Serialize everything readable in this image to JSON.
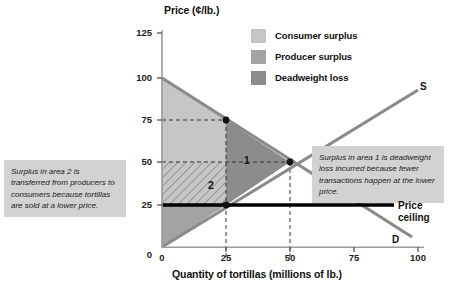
{
  "chart_data": {
    "type": "line",
    "title": "",
    "xlabel": "Quantity of tortillas (millions of lb.)",
    "ylabel": "Price (¢/lb.)",
    "xlim": [
      0,
      100
    ],
    "ylim": [
      0,
      125
    ],
    "xticks": [
      "0",
      "25",
      "50",
      "75",
      "100"
    ],
    "yticks": [
      "0",
      "25",
      "50",
      "75",
      "100",
      "125"
    ],
    "grid": false,
    "series": [
      {
        "name": "S",
        "label": "S",
        "type": "line",
        "x": [
          0,
          100
        ],
        "y": [
          0,
          100
        ],
        "color": "#8a8a8a"
      },
      {
        "name": "D",
        "label": "D",
        "type": "line",
        "x": [
          0,
          100
        ],
        "y": [
          100,
          0
        ],
        "color": "#8a8a8a"
      },
      {
        "name": "Price ceiling",
        "label": "Price ceiling",
        "type": "hline",
        "y": 25,
        "x": [
          0,
          100
        ],
        "color": "#000000"
      }
    ],
    "points": [
      {
        "x": 25,
        "y": 75,
        "note": "demand price at restricted quantity"
      },
      {
        "x": 50,
        "y": 50,
        "note": "free-market equilibrium"
      },
      {
        "x": 25,
        "y": 25,
        "note": "quantity supplied at price ceiling"
      }
    ],
    "regions": [
      {
        "label": "Consumer surplus",
        "color": "#c6c6c6"
      },
      {
        "label": "Producer surplus",
        "color": "#a3a3a3"
      },
      {
        "label": "Deadweight loss",
        "color": "#8c8c8c",
        "number": "1"
      },
      {
        "label": "Transferred surplus",
        "number": "2",
        "hatched": true
      }
    ]
  },
  "axes": {
    "y_title": "Price (¢/lb.)",
    "x_title": "Quantity of tortillas (millions of lb.)",
    "y_ticks": [
      "125",
      "100",
      "75",
      "50",
      "25",
      "0"
    ],
    "x_ticks": [
      "0",
      "25",
      "50",
      "75",
      "100"
    ]
  },
  "legend": {
    "items": [
      {
        "label": "Consumer surplus",
        "color": "#c6c6c6"
      },
      {
        "label": "Producer surplus",
        "color": "#a3a3a3"
      },
      {
        "label": "Deadweight loss",
        "color": "#8c8c8c"
      }
    ]
  },
  "annotations": {
    "left": "Surplus in area 2 is transferred from producers to consumers because tortillas are sold at a lower price.",
    "right": "Surplus in area 1 is deadweight loss incurred because fewer transactions happen at the lower price."
  },
  "curve_labels": {
    "supply": "S",
    "demand": "D",
    "price_ceiling": "Price\nceiling"
  },
  "region_numbers": {
    "deadweight": "1",
    "transfer": "2"
  },
  "colors": {
    "consumer_surplus": "#c6c6c6",
    "producer_surplus": "#a3a3a3",
    "deadweight_loss": "#8c8c8c",
    "curve": "#8a8a8a",
    "ceiling": "#000000",
    "callout_bg": "#d2d2d2"
  }
}
